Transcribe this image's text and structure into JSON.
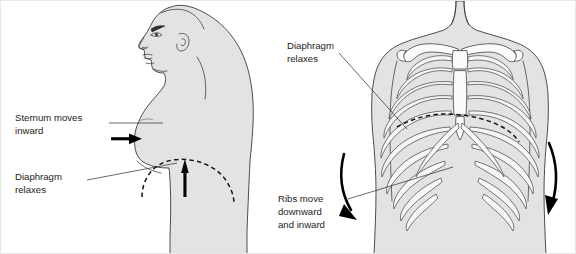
{
  "figure": {
    "background_color": "#ffffff",
    "body_fill_color": "#e3e3e3",
    "outline_color": "#3a3a3a",
    "bone_fill_color": "#fbfbfb",
    "arrow_color": "#000000",
    "text_color": "#1d1d1d",
    "width": 576,
    "height": 254
  },
  "labels": {
    "sternum": {
      "line1": "Sternum moves",
      "line2": "inward"
    },
    "diaphragm_left": {
      "line1": "Diaphragm",
      "line2": "relaxes"
    },
    "diaphragm_right": {
      "line1": "Diaphragm",
      "line2": "relaxes"
    },
    "ribs": {
      "line1": "Ribs move",
      "line2": "downward",
      "line3": "and inward"
    }
  },
  "panels": {
    "left": {
      "name": "lateral-view",
      "description": "Side profile view of head and torso facing left"
    },
    "right": {
      "name": "anterior-view",
      "description": "Front view of chest showing rib cage, sternum and clavicles"
    }
  },
  "icons": {
    "sternum_arrow": "arrow-right-icon",
    "diaphragm_arrow": "arrow-up-icon",
    "rib_arrow_left": "curved-arrow-down-icon",
    "rib_arrow_right": "curved-arrow-down-icon"
  }
}
